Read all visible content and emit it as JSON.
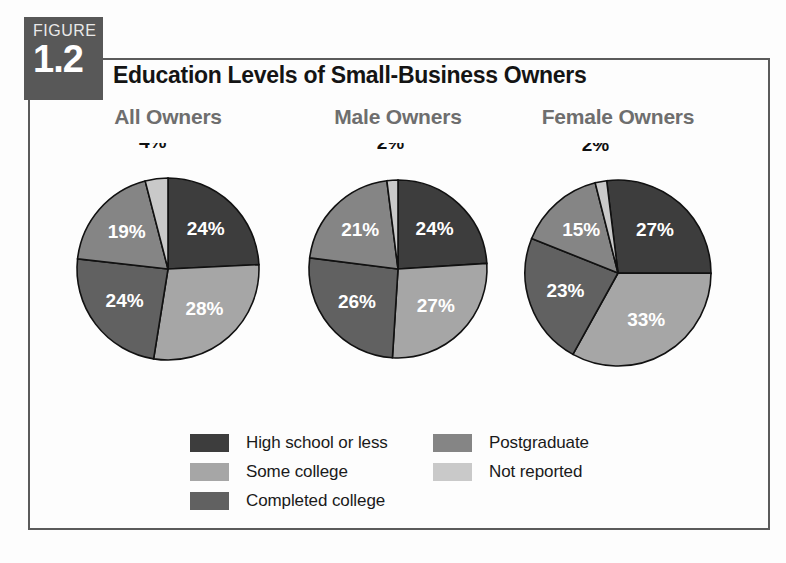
{
  "figure": {
    "badge_word": "FIGURE",
    "badge_number": "1.2",
    "title": "Education Levels of Small-Business Owners"
  },
  "colors": {
    "high_school_or_less": "#3d3d3d",
    "some_college": "#a6a6a6",
    "completed_college": "#616161",
    "postgraduate": "#858585",
    "not_reported": "#c9c9c9",
    "slice_outline": "#111111",
    "heading_gray": "#6e6e6e",
    "frame": "#5b5b5b",
    "badge_bg": "#585858"
  },
  "legend": {
    "column_one": [
      {
        "label": "High school or less",
        "color": "#3d3d3d",
        "icon": "color-swatch-icon"
      },
      {
        "label": "Some college",
        "color": "#a6a6a6",
        "icon": "color-swatch-icon"
      },
      {
        "label": "Completed college",
        "color": "#616161",
        "icon": "color-swatch-icon"
      }
    ],
    "column_two": [
      {
        "label": "Postgraduate",
        "color": "#858585",
        "icon": "color-swatch-icon"
      },
      {
        "label": "Not reported",
        "color": "#c9c9c9",
        "icon": "color-swatch-icon"
      }
    ]
  },
  "chart_data": {
    "type": "pie",
    "title": "Education Levels of Small-Business Owners",
    "categories": [
      "High school or less",
      "Some college",
      "Completed college",
      "Postgraduate",
      "Not reported"
    ],
    "category_colors": [
      "#3d3d3d",
      "#a6a6a6",
      "#616161",
      "#858585",
      "#c9c9c9"
    ],
    "units": "percent",
    "legend_position": "bottom",
    "grid": false,
    "charts": [
      {
        "title": "All Owners",
        "values": [
          24,
          28,
          24,
          19,
          4
        ],
        "labels": [
          "24%",
          "28%",
          "24%",
          "19%",
          "4%"
        ],
        "label_placement": [
          "inside",
          "inside",
          "inside",
          "inside",
          "outside"
        ]
      },
      {
        "title": "Male Owners",
        "values": [
          24,
          27,
          26,
          21,
          2
        ],
        "labels": [
          "24%",
          "27%",
          "26%",
          "21%",
          "2%"
        ],
        "label_placement": [
          "inside",
          "inside",
          "inside",
          "inside",
          "outside"
        ]
      },
      {
        "title": "Female Owners",
        "values": [
          27,
          33,
          23,
          15,
          2
        ],
        "labels": [
          "27%",
          "33%",
          "23%",
          "15%",
          "2%"
        ],
        "label_placement": [
          "inside",
          "inside",
          "inside",
          "inside",
          "outside"
        ]
      }
    ]
  }
}
